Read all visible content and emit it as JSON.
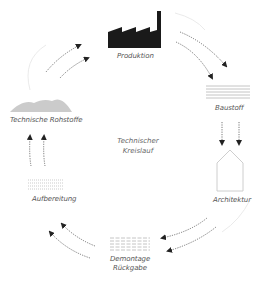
{
  "diagram": {
    "center_label": [
      "Technischer",
      "Kreislauf"
    ],
    "nodes": [
      {
        "id": "produktion",
        "label": "Produktion",
        "icon": "factory-icon"
      },
      {
        "id": "baustoff",
        "label": "Baustoff",
        "icon": "material-layers-icon"
      },
      {
        "id": "architektur",
        "label": "Architektur",
        "icon": "house-outline-icon"
      },
      {
        "id": "demontage",
        "label": "Demontage",
        "label2": "Rückgabe",
        "icon": "dismantled-elements-icon"
      },
      {
        "id": "aufbereitung",
        "label": "Aufbereitung",
        "icon": "processing-grid-icon"
      },
      {
        "id": "rohstoffe",
        "label": "Technische Rohstoffe",
        "icon": "raw-material-hills-icon"
      }
    ],
    "flow": [
      "Produktion",
      "Baustoff",
      "Architektur",
      "Demontage Rückgabe",
      "Aufbereitung",
      "Technische Rohstoffe",
      "Produktion"
    ],
    "colors": {
      "icon_dark": "#1a1a1a",
      "arrow": "#222222",
      "hills": "#c8c8c8",
      "lines": "#b8b8b8",
      "label": "#555555"
    }
  }
}
